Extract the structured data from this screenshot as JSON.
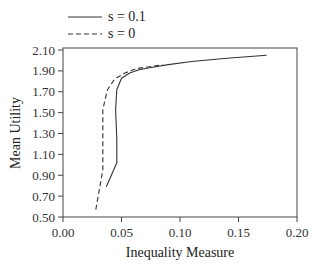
{
  "chart_data": {
    "type": "line",
    "title": "",
    "xlabel": "Inequality Measure",
    "ylabel": "Mean Utility",
    "xlim": [
      0.0,
      0.2
    ],
    "ylim": [
      0.5,
      2.1
    ],
    "xticks": [
      "0.00",
      "0.05",
      "0.10",
      "0.15",
      "0.20"
    ],
    "yticks": [
      "0.50",
      "0.70",
      "0.90",
      "1.10",
      "1.30",
      "1.50",
      "1.70",
      "1.90",
      "2.10"
    ],
    "grid": false,
    "legend_position": "top-left-outside",
    "series": [
      {
        "name": "s = 0.1",
        "style": "solid",
        "x": [
          0.037,
          0.046,
          0.046,
          0.045,
          0.046,
          0.05,
          0.057,
          0.065,
          0.074,
          0.09,
          0.11,
          0.14,
          0.174
        ],
        "y": [
          0.79,
          1.02,
          1.25,
          1.53,
          1.72,
          1.83,
          1.88,
          1.91,
          1.93,
          1.96,
          1.99,
          2.02,
          2.05
        ]
      },
      {
        "name": "s = 0",
        "style": "dashed",
        "x": [
          0.028,
          0.034,
          0.034,
          0.034,
          0.038,
          0.044,
          0.053,
          0.062,
          0.074,
          0.085
        ],
        "y": [
          0.57,
          0.95,
          1.25,
          1.53,
          1.72,
          1.82,
          1.88,
          1.92,
          1.94,
          1.96
        ]
      }
    ]
  },
  "legend": {
    "solid_label": "s = 0.1",
    "dashed_label": "s = 0"
  }
}
